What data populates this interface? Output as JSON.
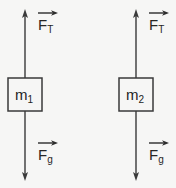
{
  "figure": {
    "type": "free-body-diagram",
    "background_color": "#f6f6f5",
    "stroke_color": "#3a3a3a",
    "text_color": "#262626",
    "width": 176,
    "height": 188
  },
  "bodies": [
    {
      "id": "body-1",
      "mass_symbol": "m",
      "mass_subscript": "1",
      "box": {
        "x": 8,
        "y": 78,
        "width": 34,
        "height": 33
      },
      "center_x": 25,
      "forces": [
        {
          "name": "tension",
          "symbol": "F",
          "subscript": "T",
          "direction": "up",
          "label_x": 38,
          "label_y": 20,
          "vector_bar": true,
          "arrow_from_y": 78,
          "arrow_to_y": 10
        },
        {
          "name": "gravity",
          "symbol": "F",
          "subscript": "g",
          "direction": "down",
          "label_x": 38,
          "label_y": 150,
          "vector_bar": true,
          "arrow_from_y": 111,
          "arrow_to_y": 180
        }
      ]
    },
    {
      "id": "body-2",
      "mass_symbol": "m",
      "mass_subscript": "2",
      "box": {
        "x": 119,
        "y": 78,
        "width": 34,
        "height": 33
      },
      "center_x": 136,
      "forces": [
        {
          "name": "tension",
          "symbol": "F",
          "subscript": "T",
          "direction": "up",
          "label_x": 149,
          "label_y": 20,
          "vector_bar": true,
          "arrow_from_y": 78,
          "arrow_to_y": 10
        },
        {
          "name": "gravity",
          "symbol": "F",
          "subscript": "g",
          "direction": "down",
          "label_x": 149,
          "label_y": 150,
          "vector_bar": true,
          "arrow_from_y": 111,
          "arrow_to_y": 180
        }
      ]
    }
  ],
  "labels": {
    "body1_tension": "F",
    "body1_tension_sub": "T",
    "body1_gravity": "F",
    "body1_gravity_sub": "g",
    "body1_mass": "m",
    "body1_mass_sub": "1",
    "body2_tension": "F",
    "body2_tension_sub": "T",
    "body2_gravity": "F",
    "body2_gravity_sub": "g",
    "body2_mass": "m",
    "body2_mass_sub": "2"
  }
}
